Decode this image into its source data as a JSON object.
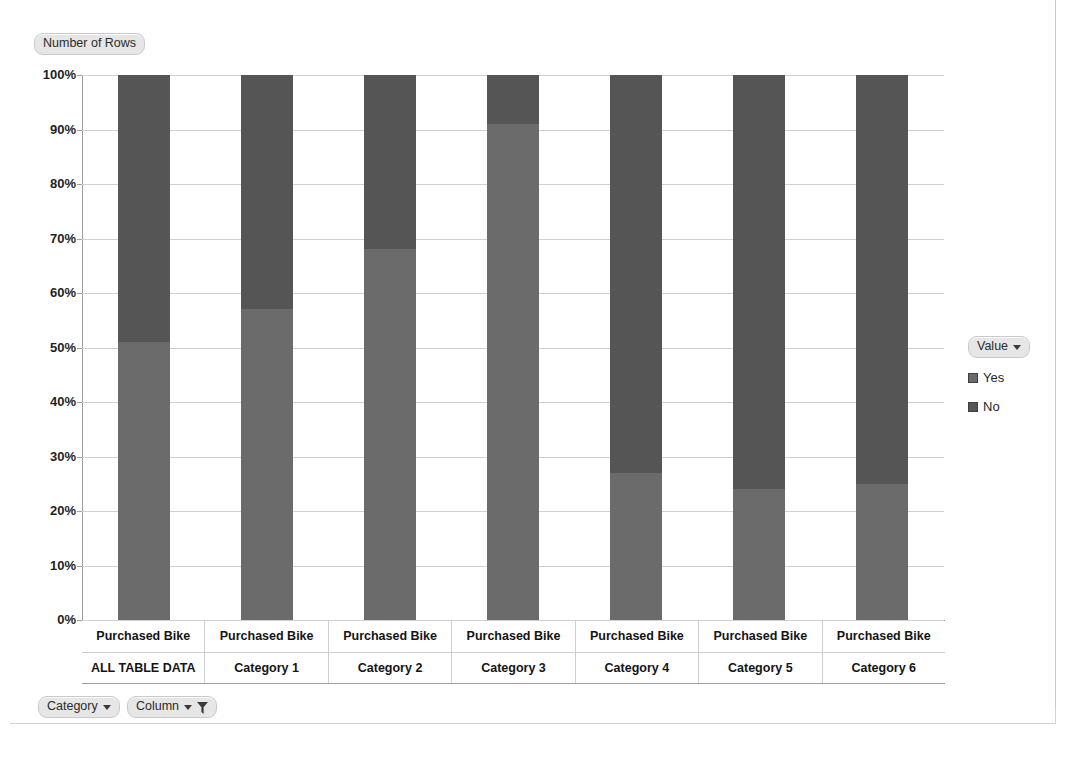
{
  "field_buttons": {
    "number_of_rows": "Number of Rows",
    "category": "Category",
    "column": "Column"
  },
  "legend": {
    "title": "Value",
    "entries": [
      {
        "label": "Yes",
        "color": "#6b6b6b"
      },
      {
        "label": "No",
        "color": "#555555"
      }
    ]
  },
  "chart_data": {
    "type": "bar",
    "title": "Number of Rows",
    "subtitle": "",
    "xlabel": "",
    "ylabel": "",
    "stacked": "100%",
    "grid": true,
    "legend_position": "right",
    "ylim": [
      0,
      100
    ],
    "ytick_labels": [
      "100%",
      "90%",
      "80%",
      "70%",
      "60%",
      "50%",
      "40%",
      "30%",
      "20%",
      "10%",
      "0%"
    ],
    "yticks": [
      100,
      90,
      80,
      70,
      60,
      50,
      40,
      30,
      20,
      10,
      0
    ],
    "categories": [
      "ALL TABLE DATA",
      "Category 1",
      "Category 2",
      "Category 3",
      "Category 4",
      "Category 5",
      "Category 6"
    ],
    "category_top_label": "Purchased Bike",
    "series": [
      {
        "name": "Yes",
        "color": "#6b6b6b",
        "values": [
          51,
          57,
          68,
          91,
          27,
          24,
          25
        ]
      },
      {
        "name": "No",
        "color": "#555555",
        "values": [
          49,
          43,
          32,
          9,
          73,
          76,
          75
        ]
      }
    ]
  }
}
